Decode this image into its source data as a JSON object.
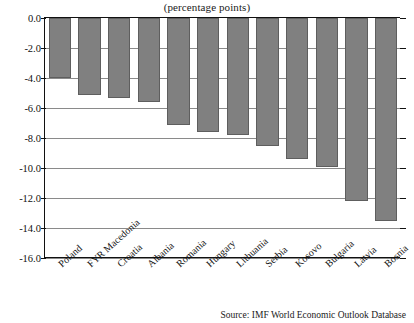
{
  "chart_data": {
    "type": "bar",
    "title": "(percentage points)",
    "xlabel": "",
    "ylabel": "",
    "ylim": [
      -16.0,
      0.0
    ],
    "ytick_step": 2.0,
    "ytick_labels": [
      "0.0",
      "-2.0",
      "-4.0",
      "-6.0",
      "-8.0",
      "-10.0",
      "-12.0",
      "-14.0",
      "-16.0"
    ],
    "ytick_values": [
      0.0,
      -2.0,
      -4.0,
      -6.0,
      -8.0,
      -10.0,
      -12.0,
      -14.0,
      -16.0
    ],
    "grid": true,
    "grid_axis": "y",
    "legend": false,
    "legend_position": "none",
    "bar_color": "#808080",
    "bar_edge_color": "#5e5e5e",
    "orientation": "vertical",
    "categories": [
      "Poland",
      "FYR Macedonia",
      "Croatia",
      "Albania",
      "Romania",
      "Hungary",
      "Lithuania",
      "Serbia",
      "Kosovo",
      "Bulgaria",
      "Latvia",
      "Bosnia"
    ],
    "values": [
      -4.0,
      -5.1,
      -5.3,
      -5.6,
      -7.1,
      -7.6,
      -7.8,
      -8.5,
      -9.4,
      -9.9,
      -12.2,
      -13.5
    ],
    "annotations": []
  },
  "source": {
    "text": "Source: IMF World Economic Outlook Database"
  }
}
